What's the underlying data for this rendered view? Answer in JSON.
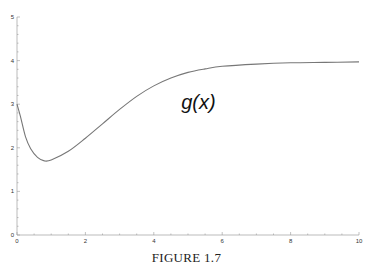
{
  "caption": "FIGURE 1.7",
  "chart_data": {
    "type": "line",
    "title": "",
    "xlabel": "",
    "ylabel": "",
    "xlim": [
      0,
      10
    ],
    "ylim": [
      0,
      5
    ],
    "grid": false,
    "legend": "none",
    "x_ticks": [
      0,
      2,
      4,
      6,
      8,
      10
    ],
    "y_ticks": [
      0,
      1,
      2,
      3,
      4,
      5
    ],
    "x_tick_labels": [
      "0",
      "2",
      "4",
      "6",
      "8",
      "10"
    ],
    "y_tick_labels": [
      "0",
      "1",
      "2",
      "3",
      "4",
      "5"
    ],
    "series": [
      {
        "name": "g(x)",
        "color": "#777777",
        "x": [
          0,
          0.1,
          0.25,
          0.4,
          0.6,
          0.8,
          1.0,
          1.5,
          2.0,
          2.5,
          3.0,
          3.5,
          4.0,
          4.5,
          5.0,
          5.5,
          6.0,
          7.0,
          8.0,
          9.0,
          10.0
        ],
        "y": [
          3.0,
          2.72,
          2.25,
          1.98,
          1.78,
          1.7,
          1.72,
          1.92,
          2.22,
          2.55,
          2.88,
          3.18,
          3.42,
          3.6,
          3.73,
          3.81,
          3.87,
          3.92,
          3.95,
          3.96,
          3.97
        ]
      }
    ],
    "annotations": [
      {
        "text": "g(x)",
        "x": 4.8,
        "y": 2.9
      }
    ]
  }
}
